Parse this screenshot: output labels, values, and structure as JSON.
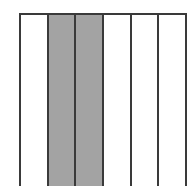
{
  "diagram": {
    "type": "fraction-strip",
    "total_parts": 6,
    "shaded_parts": 2,
    "shaded_color": "#a3a3a3",
    "unshaded_color": "#ffffff",
    "border_color": "#3a3a3a",
    "strips": [
      {
        "index": 1,
        "shaded": false
      },
      {
        "index": 2,
        "shaded": true
      },
      {
        "index": 3,
        "shaded": true
      },
      {
        "index": 4,
        "shaded": false
      },
      {
        "index": 5,
        "shaded": false
      },
      {
        "index": 6,
        "shaded": false
      }
    ]
  }
}
